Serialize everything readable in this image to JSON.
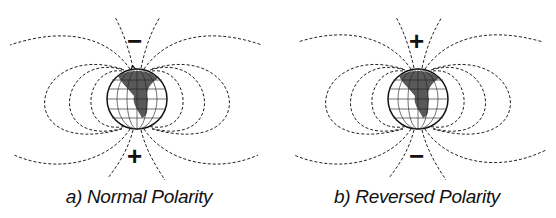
{
  "figure": {
    "panels": [
      {
        "id": "a",
        "caption": "a) Normal Polarity",
        "top_sign": "−",
        "bottom_sign": "+",
        "field_direction": "lines exit bottom pole (+) and enter top pole (−)"
      },
      {
        "id": "b",
        "caption": "b) Reversed Polarity",
        "top_sign": "+",
        "bottom_sign": "−",
        "field_direction": "lines exit top pole (+) and enter bottom pole (−)"
      }
    ],
    "line_style": "dashed",
    "colors": {
      "ink": "#111111",
      "background": "#ffffff"
    }
  }
}
